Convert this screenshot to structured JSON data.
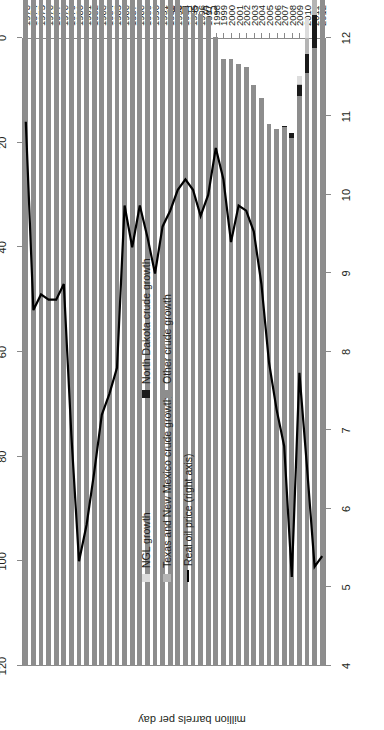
{
  "chart_data": {
    "type": "bar",
    "title": "",
    "orientation": "horizontal-rotated",
    "xlabel": "",
    "ylabel_left": "million barrels per day",
    "ylabel_right": "US dollars",
    "ylim_left": [
      4,
      12
    ],
    "ylim_right": [
      0,
      120
    ],
    "left_ticks": [
      4,
      5,
      6,
      7,
      8,
      9,
      10,
      11,
      12
    ],
    "right_ticks": [
      0,
      20,
      40,
      60,
      80,
      100,
      120
    ],
    "grid": false,
    "legend_position": "inside-left",
    "categories": [
      "1973",
      "1974",
      "1975",
      "1976",
      "1977",
      "1978",
      "1979",
      "1980",
      "1981",
      "1982",
      "1983",
      "1984",
      "1985",
      "1986",
      "1987",
      "1988",
      "1989",
      "1990",
      "1991",
      "1992",
      "1993",
      "1994",
      "1995",
      "1996",
      "1997",
      "1998",
      "1999",
      "2000",
      "2001",
      "2002",
      "2003",
      "2004",
      "2005",
      "2006",
      "2007",
      "2008",
      "2009",
      "2010",
      "2011",
      "2012"
    ],
    "series": [
      {
        "name": "Other crude growth",
        "color": "#8d8d8d",
        "values": [
          11.0,
          10.41,
          9.96,
          9.74,
          9.86,
          10.27,
          10.14,
          10.17,
          10.18,
          10.2,
          10.25,
          10.51,
          10.58,
          10.23,
          9.94,
          9.77,
          9.16,
          8.91,
          9.08,
          8.87,
          8.58,
          8.39,
          8.32,
          8.3,
          8.27,
          8.01,
          7.73,
          7.73,
          7.67,
          7.63,
          7.4,
          7.23,
          6.9,
          6.84,
          6.86,
          6.73,
          7.26,
          7.55,
          7.87,
          8.89
        ]
      },
      {
        "name": "North Dakota crude growth",
        "color": "#1a1a1a",
        "values": [
          0,
          0,
          0,
          0,
          0,
          0,
          0,
          0,
          0,
          0,
          0,
          0,
          0,
          0,
          0,
          0,
          0,
          0,
          0,
          0,
          0,
          0,
          0,
          0,
          0,
          0,
          0,
          0,
          0,
          0,
          0,
          0,
          0,
          0,
          0.02,
          0.06,
          0.14,
          0.25,
          0.42,
          0.66
        ]
      },
      {
        "name": "Texas and New Mexico crude growth",
        "color": "#b4b4b4",
        "values": [
          0,
          0,
          0,
          0,
          0,
          0,
          0,
          0,
          0,
          0,
          0,
          0,
          0,
          0,
          0,
          0,
          0,
          0,
          0,
          0,
          0,
          0,
          0,
          0,
          0,
          0,
          0,
          0,
          0,
          0,
          0,
          0,
          0,
          0,
          0,
          0,
          0.02,
          0.2,
          0.46,
          0.86
        ]
      },
      {
        "name": "NGL growth",
        "color": "#dcdcdc",
        "values": [
          0,
          0,
          0,
          0,
          0,
          0,
          0,
          0,
          0,
          0,
          0,
          0,
          0,
          0,
          0,
          0,
          0,
          0,
          0,
          0,
          0,
          0,
          0,
          0,
          0,
          0,
          0,
          0,
          0,
          0,
          0,
          0,
          0,
          0,
          0,
          0,
          0.1,
          0.26,
          0.5,
          0.82
        ]
      }
    ],
    "line": {
      "name": "Real oil price (right axis)",
      "color": "#000000",
      "axis": "right",
      "values": [
        16.0,
        52.0,
        49.0,
        50.0,
        50.0,
        47.0,
        76.0,
        100.0,
        93.0,
        83.0,
        72.0,
        68.0,
        63.0,
        32.0,
        40.0,
        32.0,
        38.0,
        45.0,
        36.0,
        33.0,
        29.0,
        27.0,
        29.0,
        34.0,
        30.0,
        21.0,
        27.0,
        39.0,
        32.0,
        33.0,
        37.0,
        47.0,
        62.0,
        71.0,
        78.0,
        103.0,
        64.0,
        82.0,
        101.0,
        99.0
      ]
    }
  },
  "legend": {
    "items_left": [
      {
        "label": "NGL growth",
        "swatch": "#dcdcdc",
        "type": "box"
      },
      {
        "label": "Texas and New Mexico crude growth",
        "swatch": "#b4b4b4",
        "type": "box"
      },
      {
        "label": "Real oil price (right axis)",
        "swatch": "#000000",
        "type": "line"
      }
    ],
    "items_right": [
      {
        "label": "North Dakota crude growth",
        "swatch": "#1a1a1a",
        "type": "box"
      },
      {
        "label": "Other crude growth",
        "swatch": "#8d8d8d",
        "type": "box"
      }
    ]
  },
  "axis_titles": {
    "left": "million barrels per day",
    "right": "US dollars"
  }
}
